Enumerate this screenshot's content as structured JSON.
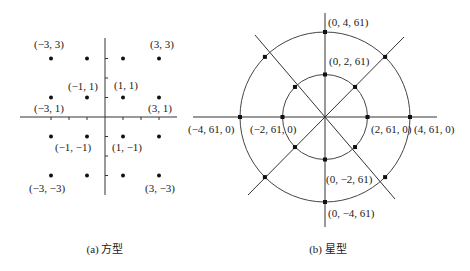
{
  "figures": [
    {
      "id": "square",
      "caption": "(a) 方型",
      "points": [
        {
          "x": -3,
          "y": 3,
          "label": "(−3, 3)"
        },
        {
          "x": -1,
          "y": 3,
          "label": ""
        },
        {
          "x": 1,
          "y": 3,
          "label": ""
        },
        {
          "x": 3,
          "y": 3,
          "label": "(3, 3)"
        },
        {
          "x": -3,
          "y": 1,
          "label": "(−3, 1)"
        },
        {
          "x": -1,
          "y": 1,
          "label": "(−1, 1)"
        },
        {
          "x": 1,
          "y": 1,
          "label": "(1, 1)"
        },
        {
          "x": 3,
          "y": 1,
          "label": "(3, 1)"
        },
        {
          "x": -3,
          "y": -1,
          "label": ""
        },
        {
          "x": -1,
          "y": -1,
          "label": "(−1, −1)"
        },
        {
          "x": 1,
          "y": -1,
          "label": "(1, −1)"
        },
        {
          "x": 3,
          "y": -1,
          "label": ""
        },
        {
          "x": -3,
          "y": -3,
          "label": "(−3, −3)"
        },
        {
          "x": -1,
          "y": -3,
          "label": ""
        },
        {
          "x": 1,
          "y": -3,
          "label": ""
        },
        {
          "x": 3,
          "y": -3,
          "label": "(3, −3)"
        }
      ]
    },
    {
      "id": "star",
      "caption": "(b) 星型",
      "radii": [
        2,
        4
      ],
      "points": [
        {
          "r": 4,
          "angle": 90,
          "label": "(0, 4, 61)"
        },
        {
          "r": 2,
          "angle": 90,
          "label": "(0, 2, 61)"
        },
        {
          "r": 4,
          "angle": 180,
          "label": "(−4, 61, 0)"
        },
        {
          "r": 2,
          "angle": 180,
          "label": "(−2, 61, 0)"
        },
        {
          "r": 2,
          "angle": 0,
          "label": "(2, 61, 0)"
        },
        {
          "r": 4,
          "angle": 0,
          "label": "(4, 61, 0)"
        },
        {
          "r": 2,
          "angle": 270,
          "label": "(0, −2, 61)"
        },
        {
          "r": 4,
          "angle": 270,
          "label": "(0, −4, 61)"
        },
        {
          "r": 4,
          "angle": 45,
          "label": ""
        },
        {
          "r": 2,
          "angle": 45,
          "label": ""
        },
        {
          "r": 4,
          "angle": 135,
          "label": ""
        },
        {
          "r": 2,
          "angle": 135,
          "label": ""
        },
        {
          "r": 4,
          "angle": 225,
          "label": ""
        },
        {
          "r": 2,
          "angle": 225,
          "label": ""
        },
        {
          "r": 4,
          "angle": 315,
          "label": ""
        },
        {
          "r": 2,
          "angle": 315,
          "label": ""
        }
      ]
    }
  ]
}
